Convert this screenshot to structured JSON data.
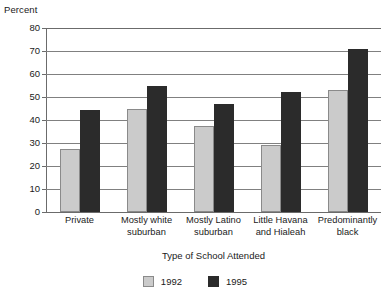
{
  "chart_data": {
    "type": "bar",
    "title": "",
    "xlabel": "Type of School Attended",
    "ylabel": "Percent",
    "ylim": [
      0,
      80
    ],
    "yticks": [
      0,
      10,
      20,
      30,
      40,
      50,
      60,
      70,
      80
    ],
    "grid": true,
    "legend_position": "bottom",
    "categories": [
      "Private",
      "Mostly white suburban",
      "Mostly Latino suburban",
      "Little Havana and Hialeah",
      "Predominantly black"
    ],
    "category_lines": [
      [
        "Private"
      ],
      [
        "Mostly white",
        "suburban"
      ],
      [
        "Mostly Latino",
        "suburban"
      ],
      [
        "Little Havana",
        "and Hialeah"
      ],
      [
        "Predominantly",
        "black"
      ]
    ],
    "series": [
      {
        "name": "1992",
        "color": "#cbcbcb",
        "values": [
          27.5,
          45,
          37.5,
          29,
          53
        ]
      },
      {
        "name": "1995",
        "color": "#2b2b2b",
        "values": [
          44.5,
          55,
          47,
          52,
          71
        ]
      }
    ]
  },
  "axes": {
    "y_title": "Percent",
    "x_title": "Type of School Attended",
    "y_tick_labels": [
      "80",
      "70",
      "60",
      "50",
      "40",
      "30",
      "20",
      "10",
      "0"
    ]
  },
  "legend": {
    "items": [
      {
        "label": "1992",
        "color": "#cbcbcb"
      },
      {
        "label": "1995",
        "color": "#2b2b2b"
      }
    ]
  }
}
